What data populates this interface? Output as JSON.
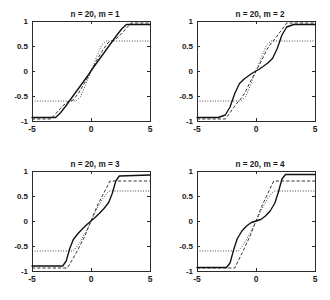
{
  "figure": {
    "background_color": "#ffffff",
    "rows": 2,
    "cols": 2,
    "panel_count": 4
  },
  "chart_data": [
    {
      "type": "line",
      "title": "n = 20, m = 1",
      "xlabel": "",
      "ylabel": "",
      "xlim": [
        -5,
        5
      ],
      "ylim": [
        -1,
        1
      ],
      "xticks": [
        -5,
        0,
        5
      ],
      "xticklabels": [
        "-5",
        "0",
        "5"
      ],
      "yticks": [
        -1,
        -0.5,
        0,
        0.5,
        1
      ],
      "yticklabels": [
        "-1",
        "-0.5",
        "0",
        "0.5",
        "1"
      ],
      "grid": false,
      "legend": "none",
      "series": [
        {
          "name": "target-sigmoid-solid",
          "style": "solid",
          "x": [
            -5.0,
            -4.5,
            -4.0,
            -3.5,
            -3.0,
            -2.6,
            -2.2,
            -1.8,
            -1.4,
            -1.0,
            -0.6,
            -0.2,
            0.0,
            0.2,
            0.6,
            1.0,
            1.4,
            1.8,
            2.2,
            2.6,
            3.0,
            3.5,
            4.0,
            4.5,
            5.0
          ],
          "y": [
            -0.93,
            -0.93,
            -0.93,
            -0.93,
            -0.93,
            -0.84,
            -0.72,
            -0.59,
            -0.46,
            -0.33,
            -0.2,
            -0.07,
            0.0,
            0.07,
            0.2,
            0.33,
            0.46,
            0.59,
            0.72,
            0.84,
            0.93,
            0.93,
            0.93,
            0.93,
            0.93
          ]
        },
        {
          "name": "approximation-dashed",
          "style": "dashed",
          "x": [
            -5.0,
            -3.4,
            -3.4,
            -2.4,
            -2.0,
            -1.5,
            -1.0,
            -0.5,
            0.0,
            0.5,
            1.0,
            1.5,
            2.0,
            2.4,
            3.4,
            3.4,
            5.0
          ],
          "y": [
            -0.96,
            -0.96,
            -0.96,
            -0.7,
            -0.62,
            -0.58,
            -0.42,
            -0.22,
            0.0,
            0.22,
            0.42,
            0.58,
            0.62,
            0.7,
            0.96,
            0.96,
            0.96
          ]
        },
        {
          "name": "approximation-dashdot",
          "style": "dashdot",
          "x": [
            -5.0,
            -1.3,
            -1.3,
            -0.9,
            -0.5,
            0.0,
            0.5,
            0.9,
            1.3,
            1.3,
            5.0
          ],
          "y": [
            -0.6,
            -0.6,
            -0.6,
            -0.52,
            -0.3,
            0.0,
            0.3,
            0.52,
            0.6,
            0.6,
            0.6
          ]
        }
      ]
    },
    {
      "type": "line",
      "title": "n = 20, m = 2",
      "xlabel": "",
      "ylabel": "",
      "xlim": [
        -5,
        5
      ],
      "ylim": [
        -1,
        1
      ],
      "xticks": [
        -5,
        0,
        5
      ],
      "xticklabels": [
        "-5",
        "0",
        "5"
      ],
      "yticks": [
        -1,
        -0.5,
        0,
        0.5,
        1
      ],
      "yticklabels": [
        "-1",
        "-0.5",
        "0",
        "0.5",
        "1"
      ],
      "grid": false,
      "legend": "none",
      "series": [
        {
          "name": "target-sigmoid-solid",
          "style": "solid",
          "x": [
            -5.0,
            -3.2,
            -2.6,
            -2.2,
            -1.8,
            -1.4,
            -1.0,
            -0.6,
            -0.3,
            0.0,
            0.3,
            0.6,
            1.0,
            1.4,
            1.8,
            2.2,
            2.6,
            3.2,
            5.0
          ],
          "y": [
            -0.93,
            -0.93,
            -0.88,
            -0.72,
            -0.45,
            -0.25,
            -0.16,
            -0.09,
            -0.04,
            0.0,
            0.04,
            0.09,
            0.16,
            0.25,
            0.45,
            0.72,
            0.88,
            0.93,
            0.93
          ]
        },
        {
          "name": "approximation-dashed",
          "style": "dashed",
          "x": [
            -5.0,
            -2.6,
            -2.6,
            -1.6,
            -1.3,
            -0.9,
            -0.5,
            0.0,
            0.5,
            0.9,
            1.3,
            1.6,
            2.6,
            2.6,
            5.0
          ],
          "y": [
            -0.96,
            -0.96,
            -0.96,
            -0.64,
            -0.56,
            -0.42,
            -0.22,
            0.0,
            0.22,
            0.42,
            0.56,
            0.64,
            0.96,
            0.96,
            0.96
          ]
        },
        {
          "name": "approximation-dashdot",
          "style": "dashdot",
          "x": [
            -5.0,
            -1.3,
            -1.3,
            -0.9,
            -0.5,
            0.0,
            0.5,
            0.9,
            1.3,
            1.3,
            5.0
          ],
          "y": [
            -0.6,
            -0.6,
            -0.6,
            -0.52,
            -0.3,
            0.0,
            0.3,
            0.52,
            0.6,
            0.6,
            0.6
          ]
        }
      ]
    },
    {
      "type": "line",
      "title": "n = 20, m = 3",
      "xlabel": "",
      "ylabel": "",
      "xlim": [
        -5,
        5
      ],
      "ylim": [
        -1,
        1
      ],
      "xticks": [
        -5,
        0,
        5
      ],
      "xticklabels": [
        "-5",
        "0",
        "5"
      ],
      "yticks": [
        -1,
        -0.5,
        0,
        0.5,
        1
      ],
      "yticklabels": [
        "-1",
        "-0.5",
        "0",
        "0.5",
        "1"
      ],
      "grid": false,
      "legend": "none",
      "series": [
        {
          "name": "target-sigmoid-solid",
          "style": "solid",
          "x": [
            -5.0,
            -2.4,
            -2.1,
            -1.8,
            -1.5,
            -1.1,
            -0.7,
            -0.3,
            0.0,
            0.3,
            0.7,
            1.1,
            1.5,
            1.8,
            2.1,
            2.4,
            5.0
          ],
          "y": [
            -0.9,
            -0.9,
            -0.8,
            -0.55,
            -0.37,
            -0.25,
            -0.15,
            -0.06,
            0.0,
            0.06,
            0.15,
            0.25,
            0.37,
            0.55,
            0.8,
            0.9,
            0.92
          ]
        },
        {
          "name": "approximation-dashed",
          "style": "dashed",
          "x": [
            -5.0,
            -2.0,
            -2.0,
            -1.4,
            -1.0,
            -0.6,
            -0.2,
            0.0,
            0.2,
            0.6,
            1.0,
            1.4,
            1.6,
            1.6,
            5.0
          ],
          "y": [
            -0.94,
            -0.94,
            -0.94,
            -0.7,
            -0.52,
            -0.34,
            -0.12,
            0.0,
            0.12,
            0.34,
            0.52,
            0.7,
            0.8,
            0.8,
            0.8
          ]
        },
        {
          "name": "approximation-dashdot",
          "style": "dashdot",
          "x": [
            -5.0,
            -1.5,
            -1.5,
            -1.0,
            -0.5,
            0.0,
            0.5,
            1.0,
            1.5,
            1.5,
            5.0
          ],
          "y": [
            -0.6,
            -0.6,
            -0.6,
            -0.45,
            -0.24,
            0.0,
            0.24,
            0.45,
            0.6,
            0.6,
            0.6
          ]
        }
      ]
    },
    {
      "type": "line",
      "title": "n = 20, m = 4",
      "xlabel": "",
      "ylabel": "",
      "xlim": [
        -5,
        5
      ],
      "ylim": [
        -1,
        1
      ],
      "xticks": [
        -5,
        0,
        5
      ],
      "xticklabels": [
        "-5",
        "0",
        "5"
      ],
      "yticks": [
        -1,
        -0.5,
        0,
        0.5,
        1
      ],
      "yticklabels": [
        "-1",
        "-0.5",
        "0",
        "0.5",
        "1"
      ],
      "grid": false,
      "legend": "none",
      "series": [
        {
          "name": "target-sigmoid-solid",
          "style": "solid",
          "x": [
            -5.0,
            -2.5,
            -2.2,
            -1.9,
            -1.6,
            -1.2,
            -0.8,
            -0.4,
            0.0,
            0.4,
            0.8,
            1.2,
            1.6,
            1.9,
            2.2,
            2.5,
            5.0
          ],
          "y": [
            -0.93,
            -0.93,
            -0.84,
            -0.58,
            -0.36,
            -0.2,
            -0.1,
            -0.03,
            0.0,
            0.03,
            0.1,
            0.2,
            0.36,
            0.58,
            0.84,
            0.93,
            0.93
          ]
        },
        {
          "name": "approximation-dashed",
          "style": "dashed",
          "x": [
            -5.0,
            -1.8,
            -1.8,
            -1.3,
            -0.9,
            -0.5,
            -0.2,
            0.0,
            0.2,
            0.5,
            0.9,
            1.3,
            1.5,
            1.5,
            5.0
          ],
          "y": [
            -0.94,
            -0.94,
            -0.94,
            -0.7,
            -0.5,
            -0.3,
            -0.12,
            0.0,
            0.12,
            0.3,
            0.5,
            0.7,
            0.8,
            0.8,
            0.8
          ]
        },
        {
          "name": "approximation-dashdot",
          "style": "dashdot",
          "x": [
            -5.0,
            -1.5,
            -1.5,
            -1.0,
            -0.5,
            0.0,
            0.5,
            1.0,
            1.5,
            1.5,
            5.0
          ],
          "y": [
            -0.6,
            -0.6,
            -0.6,
            -0.45,
            -0.24,
            0.0,
            0.24,
            0.45,
            0.6,
            0.6,
            0.6
          ]
        }
      ]
    }
  ]
}
